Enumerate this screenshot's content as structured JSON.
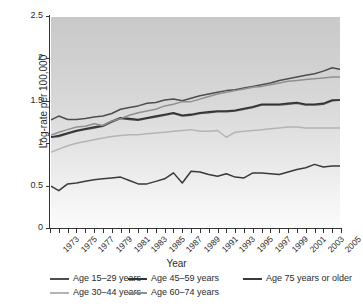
{
  "chart_data": {
    "type": "line",
    "title": "",
    "xlabel": "Year",
    "ylabel": "Log-rate per 100,000",
    "xlim": [
      1973,
      2006
    ],
    "ylim": [
      0,
      2.5
    ],
    "yticks": [
      "0",
      "0.5",
      "1",
      "1.5",
      "2",
      "2.5"
    ],
    "ytick_values": [
      0,
      0.5,
      1,
      1.5,
      2,
      2.5
    ],
    "grid": false,
    "legend_position": "below",
    "x": [
      1973,
      1974,
      1975,
      1976,
      1977,
      1978,
      1979,
      1980,
      1981,
      1982,
      1983,
      1984,
      1985,
      1986,
      1987,
      1988,
      1989,
      1990,
      1991,
      1992,
      1993,
      1994,
      1995,
      1996,
      1997,
      1998,
      1999,
      2000,
      2001,
      2002,
      2003,
      2004,
      2005,
      2006
    ],
    "xtick_labels": [
      "1973",
      "1975",
      "1977",
      "1979",
      "1981",
      "1983",
      "1985",
      "1987",
      "1989",
      "1991",
      "1993",
      "1995",
      "1997",
      "1999",
      "2001",
      "2003",
      "2005"
    ],
    "series": [
      {
        "name": "Age 15–29 years",
        "color": "#4d4d4d",
        "values": [
          1.07,
          1.08,
          1.11,
          1.14,
          1.16,
          1.18,
          1.2,
          1.25,
          1.29,
          1.28,
          1.27,
          1.29,
          1.31,
          1.33,
          1.35,
          1.32,
          1.33,
          1.35,
          1.36,
          1.37,
          1.37,
          1.38,
          1.4,
          1.42,
          1.45,
          1.45,
          1.45,
          1.46,
          1.47,
          1.45,
          1.45,
          1.46,
          1.5,
          1.51
        ]
      },
      {
        "name": "Age 30–44 years",
        "color": "#b4b4b4",
        "values": [
          0.89,
          0.93,
          0.97,
          1.0,
          1.02,
          1.04,
          1.06,
          1.08,
          1.09,
          1.1,
          1.1,
          1.11,
          1.12,
          1.13,
          1.14,
          1.15,
          1.16,
          1.14,
          1.14,
          1.15,
          1.07,
          1.13,
          1.14,
          1.15,
          1.16,
          1.17,
          1.18,
          1.19,
          1.19,
          1.18,
          1.18,
          1.18,
          1.18,
          1.18
        ]
      },
      {
        "name": "Age 45–59 years",
        "color": "#333333",
        "values": [
          1.07,
          1.09,
          1.12,
          1.15,
          1.17,
          1.19,
          1.21,
          1.26,
          1.3,
          1.29,
          1.28,
          1.3,
          1.32,
          1.34,
          1.36,
          1.33,
          1.34,
          1.36,
          1.37,
          1.38,
          1.38,
          1.39,
          1.41,
          1.43,
          1.46,
          1.46,
          1.46,
          1.47,
          1.48,
          1.46,
          1.46,
          1.47,
          1.51,
          1.51
        ]
      },
      {
        "name": "Age 60–74 years",
        "color": "#909090",
        "values": [
          1.09,
          1.13,
          1.16,
          1.19,
          1.2,
          1.23,
          1.21,
          1.26,
          1.29,
          1.33,
          1.36,
          1.38,
          1.4,
          1.44,
          1.46,
          1.49,
          1.49,
          1.52,
          1.55,
          1.58,
          1.6,
          1.62,
          1.64,
          1.66,
          1.67,
          1.69,
          1.71,
          1.73,
          1.74,
          1.75,
          1.76,
          1.77,
          1.78,
          1.78
        ]
      },
      {
        "name": "Age 75 years or older",
        "color": "#3a3a3a",
        "values": [
          0.5,
          0.44,
          0.52,
          0.53,
          0.55,
          0.57,
          0.58,
          0.59,
          0.6,
          0.56,
          0.52,
          0.52,
          0.55,
          0.58,
          0.65,
          0.53,
          0.67,
          0.66,
          0.63,
          0.61,
          0.64,
          0.6,
          0.59,
          0.65,
          0.65,
          0.64,
          0.63,
          0.66,
          0.69,
          0.71,
          0.75,
          0.72,
          0.73,
          0.73
        ]
      }
    ],
    "top_band_series": {
      "name": "upper-dark-line",
      "color": "#4d4d4d",
      "values": [
        1.27,
        1.32,
        1.28,
        1.28,
        1.29,
        1.31,
        1.32,
        1.35,
        1.4,
        1.42,
        1.44,
        1.47,
        1.48,
        1.51,
        1.52,
        1.5,
        1.53,
        1.56,
        1.58,
        1.6,
        1.62,
        1.63,
        1.65,
        1.67,
        1.69,
        1.71,
        1.74,
        1.76,
        1.78,
        1.8,
        1.82,
        1.85,
        1.89,
        1.87
      ]
    }
  },
  "legend": {
    "rows": [
      [
        {
          "label": "Age 15–29 years",
          "color": "#4d4d4d",
          "show_swatch": true
        },
        {
          "label": "Age 45–59 years",
          "color": "#333333",
          "show_swatch": true
        },
        {
          "label": "Age 75 years or older",
          "color": "#3a3a3a",
          "show_swatch": true
        }
      ],
      [
        {
          "label": "Age 30–44 years",
          "color": "#b4b4b4",
          "show_swatch": true
        },
        {
          "label": "Age 60–74 years",
          "color": "#909090",
          "show_swatch": true
        }
      ]
    ]
  },
  "colors": {
    "axis": "#333333",
    "text": "#2b2b2b",
    "plot_bg_top": "#c9c9c9",
    "plot_bg_bottom": "#fbfbfb",
    "page_bg": "#ffffff"
  }
}
